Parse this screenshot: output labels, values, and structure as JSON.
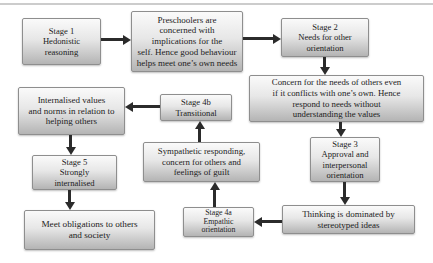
{
  "colors": {
    "box_fill_top": "#fafafa",
    "box_fill_mid": "#e7e7e7",
    "box_fill_bottom": "#b4b4b4",
    "box_border": "#8e8e8e",
    "arrow": "#2b2b2b",
    "text": "#1c1c1c",
    "top_rule": "#cccccc",
    "background": "#ffffff"
  },
  "diagram": {
    "nodes": {
      "stage1": {
        "lines": [
          "Stage 1",
          "Hedonistic",
          "reasoning"
        ]
      },
      "preschoolers": {
        "lines": [
          "Preschoolers are",
          "concerned with",
          "implications for the",
          "self. Hence good behaviour",
          "helps meet one’s own needs"
        ]
      },
      "stage2": {
        "lines": [
          "Stage 2",
          "Needs for other",
          "orientation"
        ]
      },
      "concern": {
        "lines": [
          "Concern for the needs of others even",
          "if it conflicts with one’s own. Hence",
          "respond to needs without",
          "understanding the values"
        ]
      },
      "internalised": {
        "lines": [
          "Internalised values",
          "and norms in relation to",
          "helping others"
        ]
      },
      "stage4b": {
        "lines": [
          "Stage 4b",
          "Transitional"
        ]
      },
      "stage5": {
        "lines": [
          "Stage 5",
          "Strongly",
          "internalised"
        ]
      },
      "sympathetic": {
        "lines": [
          "Sympathetic responding,",
          "concern for others and",
          "feelings of guilt"
        ]
      },
      "stage3": {
        "lines": [
          "Stage 3",
          "Approval and",
          "interpersonal",
          "orientation"
        ]
      },
      "obligations": {
        "lines": [
          "Meet obligations to others",
          "and society"
        ]
      },
      "stage4a": {
        "lines": [
          "Stage 4a",
          "Empathic",
          "orientation"
        ]
      },
      "thinking": {
        "lines": [
          "Thinking is dominated by",
          "stereotyped ideas"
        ]
      }
    },
    "edges": [
      {
        "from": "stage1",
        "to": "preschoolers",
        "direction": "right"
      },
      {
        "from": "preschoolers",
        "to": "stage2",
        "direction": "right"
      },
      {
        "from": "stage2",
        "to": "concern",
        "direction": "down"
      },
      {
        "from": "concern",
        "to": "stage3",
        "direction": "down"
      },
      {
        "from": "stage3",
        "to": "thinking",
        "direction": "down"
      },
      {
        "from": "thinking",
        "to": "stage4a",
        "direction": "left"
      },
      {
        "from": "stage4a",
        "to": "sympathetic",
        "direction": "up"
      },
      {
        "from": "sympathetic",
        "to": "stage4b",
        "direction": "up"
      },
      {
        "from": "stage4b",
        "to": "internalised",
        "direction": "left"
      },
      {
        "from": "internalised",
        "to": "stage5",
        "direction": "down"
      },
      {
        "from": "stage5",
        "to": "obligations",
        "direction": "down"
      }
    ]
  }
}
